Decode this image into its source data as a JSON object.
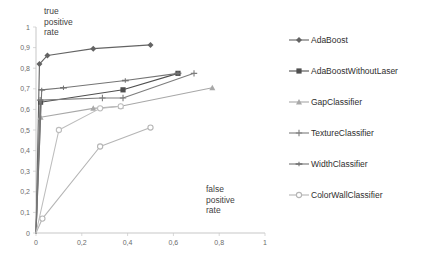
{
  "chart_data": {
    "type": "line",
    "title": "",
    "subtitle": "",
    "xlabel": "false\npositive\nrate",
    "ylabel": "true\npositive\nrate",
    "xlim": [
      0,
      1
    ],
    "ylim": [
      0,
      1
    ],
    "grid": false,
    "legend_position": "right",
    "xticks": [
      "0",
      "0,2",
      "0,4",
      "0,6",
      "0,8",
      "1"
    ],
    "xtick_values": [
      0,
      0.2,
      0.4,
      0.6,
      0.8,
      1
    ],
    "yticks": [
      "0",
      "0,1",
      "0,2",
      "0,3",
      "0,4",
      "0,5",
      "0,6",
      "0,7",
      "0,8",
      "0,9",
      "1"
    ],
    "ytick_values": [
      0,
      0.1,
      0.2,
      0.3,
      0.4,
      0.5,
      0.6,
      0.7,
      0.8,
      0.9,
      1
    ],
    "series": [
      {
        "name": "AdaBoost",
        "color": "#636363",
        "marker": "diamond",
        "x": [
          0,
          0.015,
          0.05,
          0.25,
          0.5
        ],
        "y": [
          0,
          0.82,
          0.862,
          0.895,
          0.913
        ]
      },
      {
        "name": "AdaBoostWithoutLaser",
        "color": "#4f4f4f",
        "marker": "square",
        "x": [
          0,
          0.02,
          0.38,
          0.62
        ],
        "y": [
          0,
          0.635,
          0.695,
          0.775
        ]
      },
      {
        "name": "GapClassifier",
        "color": "#a8a8a8",
        "marker": "triangle",
        "x": [
          0,
          0.02,
          0.25,
          0.37,
          0.77
        ],
        "y": [
          0,
          0.562,
          0.605,
          0.615,
          0.705
        ]
      },
      {
        "name": "TextureClassifier",
        "color": "#7d7d7d",
        "marker": "plus",
        "x": [
          0,
          0.018,
          0.29,
          0.38,
          0.69
        ],
        "y": [
          0,
          0.645,
          0.655,
          0.655,
          0.775
        ]
      },
      {
        "name": "WidthClassifier",
        "color": "#747474",
        "marker": "dash",
        "x": [
          0,
          0.025,
          0.12,
          0.39,
          0.62
        ],
        "y": [
          0,
          0.695,
          0.705,
          0.74,
          0.775
        ]
      },
      {
        "name": "ColorWallClassifier",
        "color": "#b5b5b5",
        "marker": "circle",
        "x": [
          0,
          0.028,
          0.28,
          0.5
        ],
        "y": [
          0,
          0.07,
          0.42,
          0.512
        ]
      },
      {
        "name": "ColorWallClassifierBranch",
        "color": "#bdbdbd",
        "marker": "circle",
        "x": [
          0,
          0.1,
          0.28,
          0.37
        ],
        "y": [
          0,
          0.5,
          0.605,
          0.615
        ]
      }
    ]
  },
  "legend": {
    "items": [
      {
        "label": "AdaBoost",
        "color": "#636363",
        "marker": "diamond"
      },
      {
        "label": "AdaBoostWithoutLaser",
        "color": "#4f4f4f",
        "marker": "square"
      },
      {
        "label": "GapClassifier",
        "color": "#a8a8a8",
        "marker": "triangle"
      },
      {
        "label": "TextureClassifier",
        "color": "#7d7d7d",
        "marker": "plus"
      },
      {
        "label": "WidthClassifier",
        "color": "#747474",
        "marker": "dash"
      },
      {
        "label": "ColorWallClassifier",
        "color": "#b5b5b5",
        "marker": "circle"
      }
    ]
  },
  "axes": {
    "y_caption": "true\npositive\nrate",
    "x_caption": "false\npositive\nrate"
  }
}
